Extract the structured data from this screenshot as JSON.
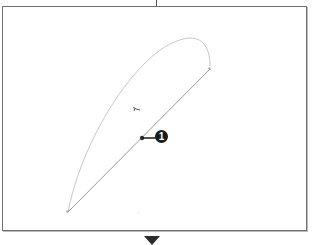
{
  "figure": {
    "callout": {
      "label": "1",
      "color": "#1a1a1a"
    },
    "colors": {
      "frame_border": "#6f6f6f",
      "curve": "#c8c8c8",
      "line": "#9a9a9a",
      "anchor": "#333333",
      "arrow": "#2a2a2a"
    },
    "elements": {
      "curve_description": "curved path segment",
      "straight_description": "straight path segment",
      "cursor": "pen-cursor"
    }
  }
}
